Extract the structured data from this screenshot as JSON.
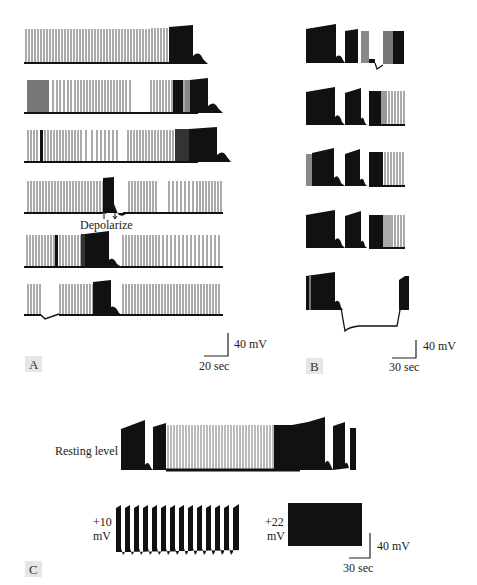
{
  "figure": {
    "panels": [
      {
        "label": "A",
        "scale_bar": {
          "voltage": "40 mV",
          "time": "20 sec"
        },
        "annotation": "Depolarize",
        "trace_count": 6
      },
      {
        "label": "B",
        "scale_bar": {
          "voltage": "40 mV",
          "time": "30 sec"
        },
        "trace_count": 5
      },
      {
        "label": "C",
        "scale_bar": {
          "voltage": "40 mV",
          "time": "30 sec"
        },
        "trace_labels": {
          "resting": "Resting level",
          "plus10_value": "+10",
          "plus10_unit": "mV",
          "plus22_value": "+22",
          "plus22_unit": "mV"
        }
      }
    ],
    "colors": {
      "trace": "#111111",
      "trace_gray": "#8a8a8a",
      "label_bg": "#e6e6e6"
    }
  }
}
